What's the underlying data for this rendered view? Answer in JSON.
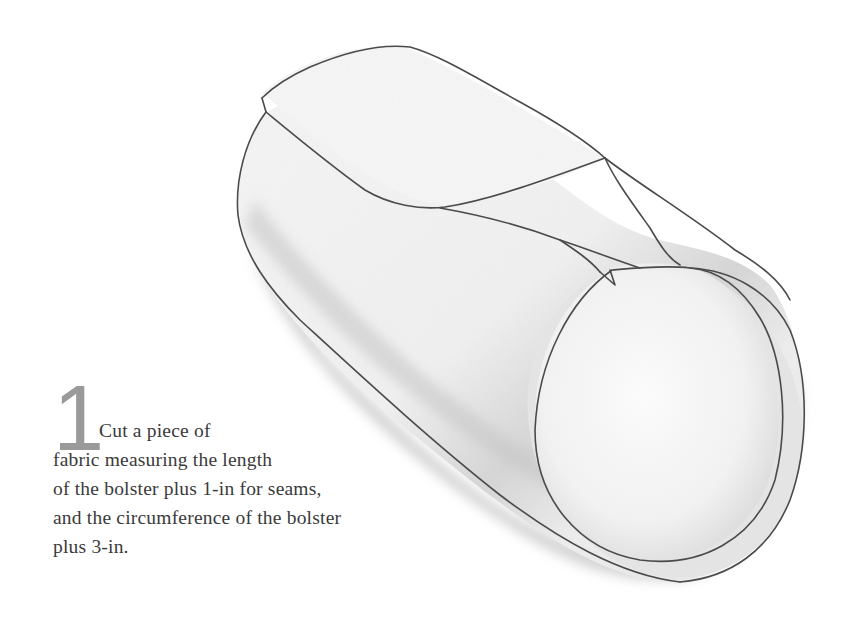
{
  "step": {
    "number": "1",
    "lines": [
      "Cut a piece of",
      "fabric measuring the length",
      "of the bolster plus 1-in for seams,",
      "and the circumference of the bolster",
      "plus 3-in."
    ]
  },
  "illustration": {
    "subject": "fabric-wrapped-bolster-cylinder",
    "outline_color": "#4a4a4a",
    "shadow_color": "#bdbdbd",
    "fabric_color": "#f4f4f4"
  }
}
